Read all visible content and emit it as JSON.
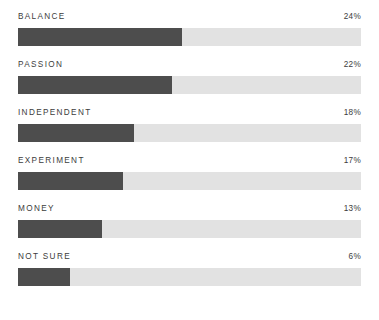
{
  "chart_data": {
    "type": "bar",
    "title": "",
    "subtitle": "",
    "xlabel": "",
    "ylabel": "",
    "orientation": "horizontal",
    "grid": false,
    "legend": false,
    "axis_visible": false,
    "value_suffix": "%",
    "track_max_percent": 50,
    "categories": [
      "BALANCE",
      "PASSION",
      "INDEPENDENT",
      "EXPERIMENT",
      "MONEY",
      "NOT SURE"
    ],
    "values": [
      24,
      22,
      18,
      17,
      13,
      6
    ],
    "value_labels": [
      "24%",
      "22%",
      "18%",
      "17%",
      "13%",
      "6%"
    ],
    "colors": {
      "fill": "#4d4d4d",
      "track": "#e2e2e2",
      "text": "#3c3c3c",
      "background": "#ffffff"
    },
    "rows": [
      {
        "label": "BALANCE",
        "value": 24,
        "value_label": "24%",
        "fill_width": "47.8%"
      },
      {
        "label": "PASSION",
        "value": 22,
        "value_label": "22%",
        "fill_width": "44.9%"
      },
      {
        "label": "INDEPENDENT",
        "value": 18,
        "value_label": "18%",
        "fill_width": "33.8%"
      },
      {
        "label": "EXPERIMENT",
        "value": 17,
        "value_label": "17%",
        "fill_width": "30.6%"
      },
      {
        "label": "MONEY",
        "value": 13,
        "value_label": "13%",
        "fill_width": "24.5%"
      },
      {
        "label": "NOT SURE",
        "value": 6,
        "value_label": "6%",
        "fill_width": "15.2%"
      }
    ]
  }
}
